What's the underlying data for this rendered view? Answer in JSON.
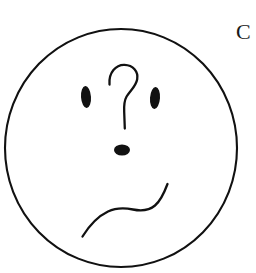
{
  "page": {
    "background_color": "#ffffff",
    "width": 256,
    "height": 273,
    "ink_color": "#111111"
  },
  "corner_label": {
    "text": "C",
    "color": "#1a1a1a",
    "position": "top-right",
    "clipped": "right edge"
  },
  "drawing": {
    "title": "confused face",
    "style": "hand-drawn line art",
    "head": {
      "name": "face-outline-circle",
      "center_x": 121,
      "center_y": 148,
      "radius_x": 116,
      "radius_y": 119,
      "stroke_color": "#111111",
      "stroke_width": 2.1,
      "fill": "none"
    },
    "left_eye": {
      "name": "left-eye",
      "center_x": 86,
      "center_y": 97,
      "radius_x": 5,
      "radius_y": 11,
      "rotation": -4,
      "fill_color": "#111111"
    },
    "right_eye": {
      "name": "right-eye",
      "center_x": 155,
      "center_y": 98,
      "radius_x": 5,
      "radius_y": 11,
      "rotation": 4,
      "fill_color": "#111111"
    },
    "question_mark": {
      "name": "question-mark",
      "path": "M109.5,84.5 C108.5,72.5 116,64.5 124.5,64.8 C133,65.1 138.5,71.5 137.2,79.2 C136.0,86.4 130.0,90.6 126.6,96.5 C124.0,101.0 123.9,106.0 124.2,112.0 C124.4,117.5 124.6,123.0 124.8,128.5",
      "stroke_color": "#111111",
      "stroke_width": 2.3,
      "fill": "none"
    },
    "nose": {
      "name": "nose-dot",
      "center_x": 122,
      "center_y": 150,
      "radius_x": 8,
      "radius_y": 5.5,
      "fill_color": "#111111"
    },
    "mouth": {
      "name": "mouth-wavy-line",
      "path": "M82.5,236.5 C89.0,226.0 97.5,216.5 108.0,211.5 C116.5,207.5 124.5,207.8 133.0,209.5 C141.5,211.2 148.5,211.0 155.0,205.5 C161.0,200.5 164.5,192.0 167.5,184.0",
      "stroke_color": "#111111",
      "stroke_width": 2.3,
      "fill": "none"
    }
  }
}
